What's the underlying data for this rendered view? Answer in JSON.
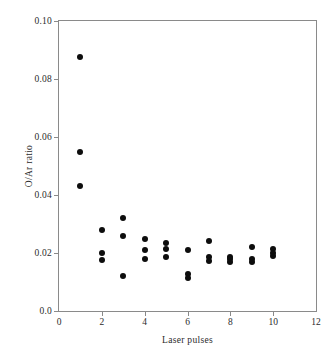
{
  "chart_data": {
    "type": "scatter",
    "title": "",
    "xlabel": "Laser pulses",
    "ylabel": "O/Ar ratio",
    "xlim": [
      0,
      12
    ],
    "ylim": [
      0.0,
      0.1
    ],
    "xticks": [
      0,
      2,
      4,
      6,
      8,
      10,
      12
    ],
    "xtick_labels": [
      "0",
      "2",
      "4",
      "6",
      "8",
      "10",
      "12"
    ],
    "yticks": [
      0.0,
      0.02,
      0.04,
      0.06,
      0.08,
      0.1
    ],
    "ytick_labels": [
      "0.0",
      "0.02",
      "0.04",
      "0.06",
      "0.08",
      "0.10"
    ],
    "grid": false,
    "legend": false,
    "marker": "filled-circle",
    "marker_color": "#0d0d0d",
    "frame_color": "#8a8a8a",
    "series": [
      {
        "name": "O/Ar ratio",
        "x": [
          1,
          1,
          1,
          2,
          2,
          2,
          3,
          3,
          3,
          4,
          4,
          4,
          5,
          5,
          5,
          6,
          6,
          6,
          7,
          7,
          7,
          8,
          8,
          8,
          9,
          9,
          9,
          10,
          10,
          10
        ],
        "y": [
          0.0875,
          0.0548,
          0.043,
          0.028,
          0.02,
          0.0175,
          0.032,
          0.026,
          0.012,
          0.0248,
          0.021,
          0.018,
          0.0236,
          0.0214,
          0.0185,
          0.021,
          0.0126,
          0.0114,
          0.024,
          0.0186,
          0.0174,
          0.0187,
          0.0178,
          0.017,
          0.022,
          0.018,
          0.017,
          0.0215,
          0.02,
          0.019
        ]
      }
    ]
  }
}
